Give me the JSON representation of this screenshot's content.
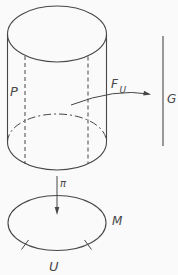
{
  "figure": {
    "colors": {
      "ink": "#474747",
      "background": "#fafafa"
    },
    "labels": {
      "total_space": "P",
      "fiber": "F",
      "fiber_subscript": "U",
      "group": "G",
      "projection": "π",
      "base_manifold": "M",
      "open_set": "U"
    }
  }
}
